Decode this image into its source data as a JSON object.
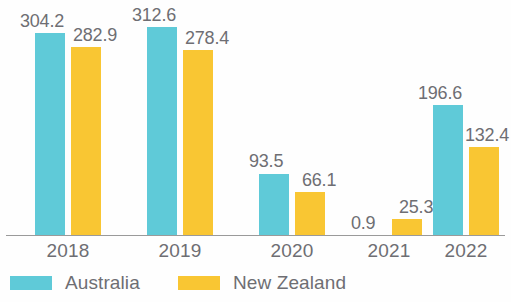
{
  "chart_data": {
    "type": "bar",
    "title": "",
    "subtitle": "",
    "xlabel": "",
    "ylabel": "",
    "categories": [
      "2018",
      "2019",
      "2020",
      "2021",
      "2022"
    ],
    "series": [
      {
        "name": "Australia",
        "color": "#5FCAD8",
        "values": [
          304.2,
          312.6,
          93.5,
          0.9,
          196.6
        ],
        "labels": [
          "304.2",
          "312.6",
          "93.5",
          "0.9",
          "196.6"
        ]
      },
      {
        "name": "New Zealand",
        "color": "#F9C633",
        "values": [
          282.9,
          278.4,
          66.1,
          25.3,
          132.4
        ],
        "labels": [
          "282.9",
          "278.4",
          "66.1",
          "25.3",
          "132.4"
        ]
      }
    ],
    "ylim": [
      0,
      320
    ],
    "grid": false,
    "legend_position": "bottom-left",
    "axis_line_color": "#9a9a9a",
    "label_color": "#6e6e73"
  },
  "legend": {
    "items": [
      {
        "label": "Australia",
        "swatch": "legend-swatch-australia"
      },
      {
        "label": "New Zealand",
        "swatch": "legend-swatch-new-zealand"
      }
    ]
  },
  "axis": {
    "ticks": [
      "2018",
      "2019",
      "2020",
      "2021",
      "2022"
    ]
  }
}
